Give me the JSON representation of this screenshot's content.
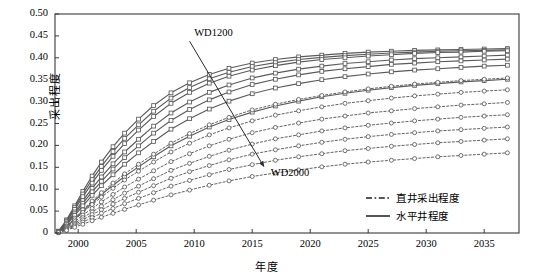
{
  "chart_data": {
    "type": "line",
    "title": "",
    "xlabel": "年度",
    "ylabel": "采出程度",
    "xlim": [
      1998,
      2038
    ],
    "ylim": [
      0,
      0.5
    ],
    "xticks": [
      "2000",
      "2005",
      "2010",
      "2015",
      "2020",
      "2025",
      "2030",
      "2035"
    ],
    "xtick_values": [
      2000,
      2005,
      2010,
      2015,
      2020,
      2025,
      2030,
      2035
    ],
    "yticks": [
      "0",
      "0.05",
      "0.10",
      "0.15",
      "0.20",
      "0.25",
      "0.30",
      "0.35",
      "0.40",
      "0.45",
      "0.50"
    ],
    "ytick_values": [
      0,
      0.05,
      0.1,
      0.15,
      0.2,
      0.25,
      0.3,
      0.35,
      0.4,
      0.45,
      0.5
    ],
    "grid": false,
    "legend_position": "lower-right",
    "legend": [
      {
        "label": "直井采出程度",
        "style": "dashed",
        "color": "#555555"
      },
      {
        "label": "水平井程度",
        "style": "solid",
        "color": "#555555"
      }
    ],
    "annotations": [
      {
        "text": "WD1200",
        "x": 2010.0,
        "y": 0.455
      },
      {
        "text": "WD2000",
        "x": 2016.6,
        "y": 0.135
      },
      {
        "type": "arrow",
        "from": {
          "x": 2009.6,
          "y": 0.438
        },
        "to": {
          "x": 2016.0,
          "y": 0.152
        }
      }
    ],
    "x": [
      1998.3,
      1999,
      1999.7,
      2000.4,
      2001.2,
      2002,
      2003,
      2004,
      2005.2,
      2006.5,
      2008,
      2009.6,
      2011.3,
      2013,
      2015,
      2017,
      2019,
      2021,
      2023,
      2025,
      2027,
      2029,
      2031,
      2033,
      2035,
      2037
    ],
    "series": [
      {
        "name": "水平井 WD1200",
        "style": "solid",
        "marker": "square",
        "values": [
          0.004,
          0.03,
          0.062,
          0.095,
          0.13,
          0.162,
          0.197,
          0.228,
          0.26,
          0.291,
          0.32,
          0.343,
          0.362,
          0.376,
          0.388,
          0.396,
          0.402,
          0.406,
          0.41,
          0.413,
          0.415,
          0.417,
          0.418,
          0.419,
          0.42,
          0.421
        ]
      },
      {
        "name": "水平井 WD1300",
        "style": "solid",
        "marker": "square",
        "values": [
          0.004,
          0.028,
          0.058,
          0.089,
          0.122,
          0.152,
          0.186,
          0.216,
          0.247,
          0.278,
          0.308,
          0.332,
          0.352,
          0.367,
          0.38,
          0.389,
          0.396,
          0.401,
          0.405,
          0.408,
          0.411,
          0.413,
          0.415,
          0.416,
          0.417,
          0.418
        ]
      },
      {
        "name": "水平井 WD1400",
        "style": "solid",
        "marker": "square",
        "values": [
          0.004,
          0.026,
          0.054,
          0.083,
          0.114,
          0.143,
          0.175,
          0.204,
          0.235,
          0.266,
          0.296,
          0.321,
          0.342,
          0.358,
          0.372,
          0.382,
          0.39,
          0.396,
          0.4,
          0.404,
          0.407,
          0.41,
          0.412,
          0.413,
          0.415,
          0.416
        ]
      },
      {
        "name": "水平井 WD1500",
        "style": "solid",
        "marker": "square",
        "values": [
          0.003,
          0.023,
          0.048,
          0.074,
          0.102,
          0.128,
          0.158,
          0.185,
          0.214,
          0.244,
          0.274,
          0.299,
          0.321,
          0.338,
          0.354,
          0.365,
          0.374,
          0.381,
          0.387,
          0.391,
          0.395,
          0.398,
          0.4,
          0.402,
          0.404,
          0.406
        ]
      },
      {
        "name": "水平井 WD1600",
        "style": "solid",
        "marker": "square",
        "values": [
          0.003,
          0.021,
          0.044,
          0.068,
          0.094,
          0.118,
          0.146,
          0.172,
          0.199,
          0.228,
          0.257,
          0.282,
          0.304,
          0.322,
          0.339,
          0.351,
          0.361,
          0.369,
          0.375,
          0.38,
          0.385,
          0.388,
          0.391,
          0.393,
          0.395,
          0.397
        ]
      },
      {
        "name": "水平井 WD1700",
        "style": "solid",
        "marker": "square",
        "values": [
          0.003,
          0.019,
          0.04,
          0.062,
          0.086,
          0.108,
          0.133,
          0.157,
          0.183,
          0.209,
          0.237,
          0.261,
          0.283,
          0.301,
          0.318,
          0.331,
          0.341,
          0.35,
          0.357,
          0.363,
          0.368,
          0.372,
          0.375,
          0.378,
          0.381,
          0.383
        ]
      },
      {
        "name": "水平井 WD1800",
        "style": "solid",
        "marker": "square",
        "values": [
          0.002,
          0.015,
          0.032,
          0.05,
          0.069,
          0.088,
          0.109,
          0.129,
          0.151,
          0.174,
          0.199,
          0.221,
          0.242,
          0.259,
          0.276,
          0.29,
          0.301,
          0.311,
          0.319,
          0.326,
          0.332,
          0.337,
          0.341,
          0.345,
          0.348,
          0.351
        ]
      },
      {
        "name": "直井 WD1200",
        "style": "dashed",
        "marker": "circle",
        "values": [
          0.002,
          0.016,
          0.034,
          0.053,
          0.073,
          0.092,
          0.114,
          0.135,
          0.157,
          0.18,
          0.205,
          0.227,
          0.247,
          0.264,
          0.281,
          0.294,
          0.305,
          0.314,
          0.322,
          0.329,
          0.335,
          0.34,
          0.344,
          0.348,
          0.351,
          0.354
        ]
      },
      {
        "name": "直井 WD1300",
        "style": "dashed",
        "marker": "circle",
        "values": [
          0.002,
          0.014,
          0.03,
          0.047,
          0.065,
          0.082,
          0.102,
          0.121,
          0.141,
          0.162,
          0.185,
          0.205,
          0.224,
          0.24,
          0.256,
          0.269,
          0.279,
          0.288,
          0.296,
          0.302,
          0.308,
          0.313,
          0.317,
          0.321,
          0.324,
          0.327
        ]
      },
      {
        "name": "直井 WD1400",
        "style": "dashed",
        "marker": "circle",
        "values": [
          0.002,
          0.012,
          0.026,
          0.041,
          0.056,
          0.071,
          0.088,
          0.105,
          0.123,
          0.142,
          0.163,
          0.181,
          0.199,
          0.214,
          0.229,
          0.241,
          0.251,
          0.26,
          0.267,
          0.274,
          0.279,
          0.284,
          0.288,
          0.292,
          0.295,
          0.298
        ]
      },
      {
        "name": "直井 WD1500",
        "style": "dashed",
        "marker": "circle",
        "values": [
          0.001,
          0.01,
          0.022,
          0.035,
          0.048,
          0.061,
          0.076,
          0.091,
          0.107,
          0.124,
          0.143,
          0.159,
          0.175,
          0.189,
          0.203,
          0.215,
          0.224,
          0.233,
          0.24,
          0.246,
          0.251,
          0.256,
          0.26,
          0.264,
          0.267,
          0.27
        ]
      },
      {
        "name": "直井 WD1600",
        "style": "dashed",
        "marker": "circle",
        "values": [
          0.001,
          0.009,
          0.019,
          0.03,
          0.042,
          0.053,
          0.066,
          0.079,
          0.093,
          0.108,
          0.125,
          0.14,
          0.154,
          0.167,
          0.18,
          0.19,
          0.199,
          0.207,
          0.214,
          0.22,
          0.225,
          0.229,
          0.233,
          0.236,
          0.239,
          0.242
        ]
      },
      {
        "name": "直井 WD1800",
        "style": "dashed",
        "marker": "circle",
        "values": [
          0.001,
          0.007,
          0.016,
          0.025,
          0.035,
          0.045,
          0.056,
          0.067,
          0.079,
          0.092,
          0.107,
          0.12,
          0.133,
          0.145,
          0.156,
          0.166,
          0.174,
          0.181,
          0.188,
          0.193,
          0.198,
          0.202,
          0.206,
          0.209,
          0.212,
          0.215
        ]
      },
      {
        "name": "直井 WD2000",
        "style": "dashed",
        "marker": "circle",
        "values": [
          0.001,
          0.006,
          0.013,
          0.02,
          0.028,
          0.036,
          0.045,
          0.054,
          0.064,
          0.075,
          0.087,
          0.098,
          0.109,
          0.119,
          0.129,
          0.137,
          0.144,
          0.151,
          0.157,
          0.162,
          0.166,
          0.17,
          0.174,
          0.177,
          0.18,
          0.183
        ]
      }
    ]
  },
  "axes": {
    "ylabel": "采出程度",
    "xlabel": "年度"
  },
  "colors": {
    "line": "#5a5a5a",
    "frame": "#3a3a3a",
    "text": "#111111"
  }
}
